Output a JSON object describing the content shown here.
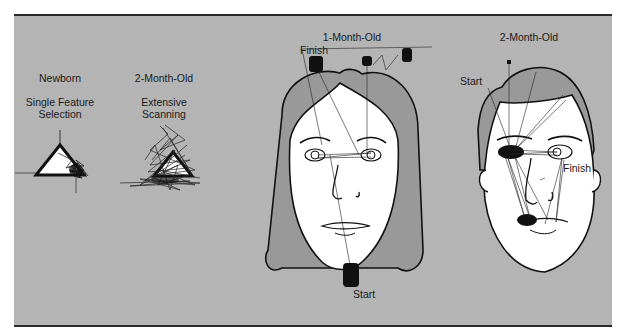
{
  "figure": {
    "panel_background": "#b4b4b4",
    "panels": [
      {
        "id": "newborn-triangle",
        "age": "Newborn",
        "caption_line1": "Single Feature",
        "caption_line2": "Selection",
        "stimulus": "triangle"
      },
      {
        "id": "two-month-triangle",
        "age": "2-Month-Old",
        "caption_line1": "Extensive",
        "caption_line2": "Scanning",
        "stimulus": "triangle"
      },
      {
        "id": "one-month-face",
        "age": "1-Month-Old",
        "start_label": "Start",
        "finish_label": "Finish",
        "stimulus": "face"
      },
      {
        "id": "two-month-face",
        "age": "2-Month-Old",
        "start_label": "Start",
        "finish_label": "Finish",
        "stimulus": "face"
      }
    ]
  }
}
